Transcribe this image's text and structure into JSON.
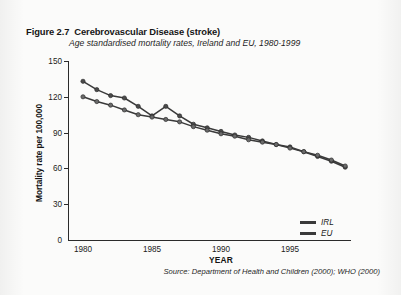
{
  "figure": {
    "number": "Figure 2.7",
    "title": "Cerebrovascular Disease (stroke)",
    "subtitle": "Age standardised  mortality rates, Ireland and EU, 1980-1999",
    "source": "Source: Department of Health and Children (2000); WHO (2000)"
  },
  "chart_data": {
    "type": "line",
    "title": "Cerebrovascular Disease (stroke)",
    "subtitle": "Age standardised  mortality rates, Ireland and EU, 1980-1999",
    "xlabel": "YEAR",
    "ylabel": "Mortality rate per 100,000",
    "xlim": [
      1979,
      2000
    ],
    "ylim": [
      0,
      150
    ],
    "yticks": [
      0,
      30,
      60,
      90,
      120,
      150
    ],
    "xticks": [
      1980,
      1985,
      1990,
      1995
    ],
    "grid": false,
    "legend_position": "bottom-right",
    "x": [
      1980,
      1981,
      1982,
      1983,
      1984,
      1985,
      1986,
      1987,
      1988,
      1989,
      1990,
      1991,
      1992,
      1993,
      1994,
      1995,
      1996,
      1997,
      1998,
      1999
    ],
    "series": [
      {
        "name": "IRL",
        "color": "#3a3a3a",
        "marker": "circle",
        "values": [
          133,
          126,
          121,
          119,
          112,
          104,
          112,
          104,
          97,
          94,
          91,
          88,
          86,
          83,
          80,
          78,
          74,
          70,
          66,
          61
        ]
      },
      {
        "name": "EU",
        "color": "#3a3a3a",
        "marker": "circle",
        "values": [
          120,
          116,
          113,
          109,
          105,
          103,
          101,
          99,
          95,
          92,
          89,
          87,
          84,
          82,
          80,
          77,
          74,
          71,
          67,
          62
        ]
      }
    ]
  },
  "axes": {
    "y_ticks": [
      "150",
      "120",
      "90",
      "60",
      "30",
      "0"
    ],
    "x_ticks": [
      "1980",
      "1985",
      "1990",
      "1995"
    ],
    "y_title": "Mortality rate per 100,000",
    "x_title": "YEAR"
  },
  "legend": {
    "items": [
      {
        "label": "IRL"
      },
      {
        "label": "EU"
      }
    ]
  }
}
